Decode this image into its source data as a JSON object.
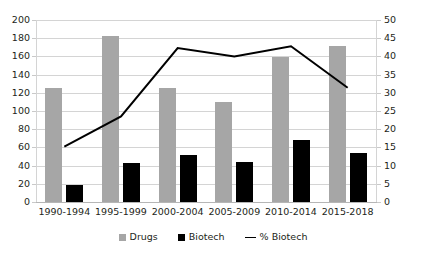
{
  "chart_data": {
    "type": "bar",
    "title": "",
    "subtitle": "",
    "xlabel": "",
    "ylabel": "",
    "grid": true,
    "legend_position": "bottom",
    "categories": [
      "1990-1994",
      "1995-1999",
      "2000-2004",
      "2005-2009",
      "2010-2014",
      "2015-2018"
    ],
    "series": [
      {
        "name": "Drugs",
        "type": "bar",
        "axis": "left",
        "color": "#a6a6a6",
        "values": [
          125,
          183,
          125,
          110,
          159,
          172
        ]
      },
      {
        "name": "Biotech",
        "type": "bar",
        "axis": "left",
        "color": "#000000",
        "values": [
          19,
          43,
          52,
          44,
          68,
          54
        ]
      },
      {
        "name": "% Biotech",
        "type": "line",
        "axis": "right",
        "color": "#000000",
        "values": [
          15.2,
          23.5,
          42.3,
          40.0,
          42.8,
          31.4
        ]
      }
    ],
    "left_axis": {
      "min": 0,
      "max": 200,
      "step": 20,
      "ticks": [
        "0",
        "20",
        "40",
        "60",
        "80",
        "100",
        "120",
        "140",
        "160",
        "180",
        "200"
      ]
    },
    "right_axis": {
      "min": 0,
      "max": 50,
      "step": 5,
      "ticks": [
        "0",
        "5",
        "10",
        "15",
        "20",
        "25",
        "30",
        "35",
        "40",
        "45",
        "50"
      ]
    },
    "legend": [
      {
        "label": "Drugs",
        "marker": "square",
        "color": "#a6a6a6"
      },
      {
        "label": "Biotech",
        "marker": "square",
        "color": "#000000"
      },
      {
        "label": "% Biotech",
        "marker": "line",
        "color": "#000000"
      }
    ]
  }
}
